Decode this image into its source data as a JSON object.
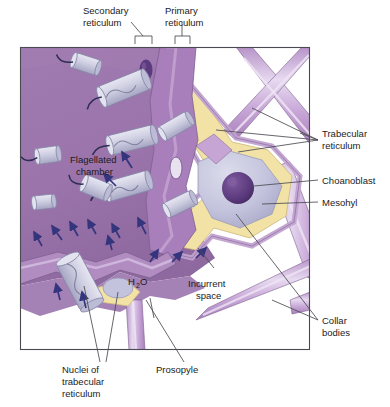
{
  "figure": {
    "background_color": "#ffffff",
    "frame": {
      "x": 20,
      "y": 47,
      "width": 290,
      "height": 303,
      "stroke": "#4a4a52"
    }
  },
  "palette": {
    "chamber_purple": "#9a74ab",
    "chamber_purple_light": "#b292c0",
    "trunk_purple": "#a87fba",
    "tube_purple": "#c6a5d4",
    "tube_highlight": "#e2d0ea",
    "mesohyl_yellow": "#f2e2a6",
    "mesohyl_yellow_edge": "#dcc87f",
    "collar_body_blue": "#ccccde",
    "collar_body_blue_dark": "#a9a9c6",
    "choanoblast_body": "#c3c3dd",
    "nucleus_dark": "#5b3a7d",
    "arrow_blue": "#35357d",
    "leader_line": "#4a4a52",
    "label_text": "#1b1b1b",
    "white": "#ffffff"
  },
  "labels": {
    "secondary_reticulum": {
      "line1": "Secondary",
      "line2": "reticulum"
    },
    "primary_reticulum": {
      "line1": "Primary",
      "line2": "reticulum"
    },
    "trabecular_reticulum": {
      "line1": "Trabecular",
      "line2": "reticulum"
    },
    "choanoblast": {
      "line1": "Choanoblast"
    },
    "mesohyl": {
      "line1": "Mesohyl"
    },
    "collar_bodies": {
      "line1": "Collar",
      "line2": "bodies"
    },
    "flagellated_chamber": {
      "line1": "Flagellated",
      "line2": "chamber"
    },
    "water": {
      "main": "H",
      "sub": "2",
      "tail": "O"
    },
    "incurrent_space": {
      "line1": "Incurrent",
      "line2": "space"
    },
    "nuclei_of_trabecular_reticulum": {
      "line1": "Nuclei of",
      "line2": "trabecular",
      "line3": "reticulum"
    },
    "prosopyle": {
      "line1": "Prosopyle"
    }
  }
}
